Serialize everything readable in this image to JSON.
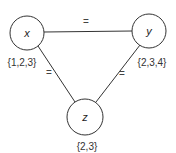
{
  "diagram": {
    "type": "constraint-graph",
    "nodes": [
      {
        "id": "x",
        "label": "x",
        "domain": "{1,2,3}"
      },
      {
        "id": "y",
        "label": "y",
        "domain": "{2,3,4}"
      },
      {
        "id": "z",
        "label": "z",
        "domain": "{2,3}"
      }
    ],
    "edges": [
      {
        "from": "x",
        "to": "y",
        "label": "="
      },
      {
        "from": "x",
        "to": "z",
        "label": "="
      },
      {
        "from": "y",
        "to": "z",
        "label": "="
      }
    ],
    "colors": {
      "stroke": "#333333",
      "background": "#ffffff"
    }
  }
}
